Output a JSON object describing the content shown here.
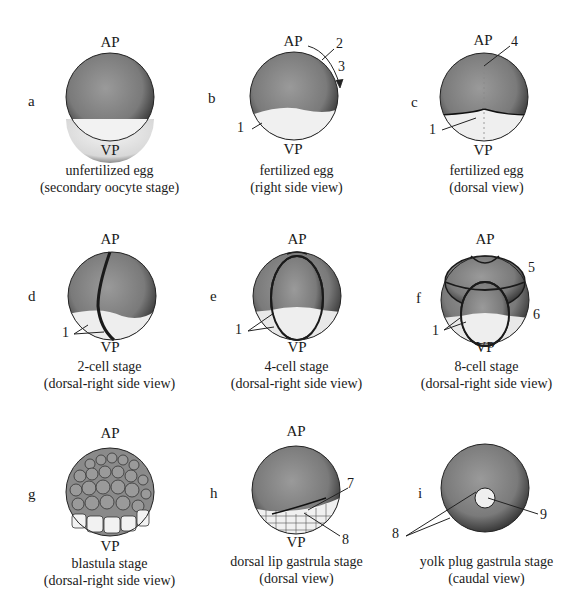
{
  "figure": {
    "panels": [
      {
        "letter": "a",
        "ap": "AP",
        "vp": "VP",
        "title": "unfertilized egg",
        "view": "(secondary oocyte stage)",
        "labels": []
      },
      {
        "letter": "b",
        "ap": "AP",
        "vp": "VP",
        "title": "fertilized egg",
        "view": "(right side view)",
        "labels": [
          "1",
          "2",
          "3"
        ]
      },
      {
        "letter": "c",
        "ap": "AP",
        "vp": "VP",
        "title": "fertilized egg",
        "view": "(dorsal view)",
        "labels": [
          "1",
          "4"
        ]
      },
      {
        "letter": "d",
        "ap": "AP",
        "vp": "VP",
        "title": "2-cell stage",
        "view": "(dorsal-right side view)",
        "labels": [
          "1"
        ]
      },
      {
        "letter": "e",
        "ap": "AP",
        "vp": "VP",
        "title": "4-cell stage",
        "view": "(dorsal-right side view)",
        "labels": [
          "1"
        ]
      },
      {
        "letter": "f",
        "ap": "AP",
        "vp": "VP",
        "title": "8-cell stage",
        "view": "(dorsal-right side view)",
        "labels": [
          "1",
          "5",
          "6"
        ]
      },
      {
        "letter": "g",
        "ap": "AP",
        "vp": "VP",
        "title": "blastula stage",
        "view": "(dorsal-right side view)",
        "labels": []
      },
      {
        "letter": "h",
        "ap": "AP",
        "vp": "VP",
        "title": "dorsal lip gastrula stage",
        "view": "(dorsal view)",
        "labels": [
          "7",
          "8"
        ]
      },
      {
        "letter": "i",
        "ap": "",
        "vp": "",
        "title": "yolk plug gastrula stage",
        "view": "(caudal view)",
        "labels": [
          "8",
          "9"
        ]
      }
    ]
  }
}
